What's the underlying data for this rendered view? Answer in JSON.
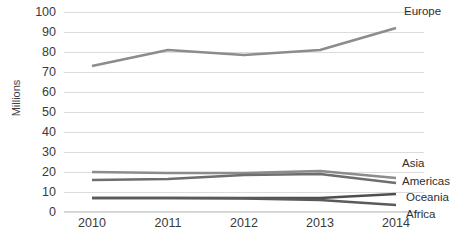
{
  "chart_data": {
    "type": "line",
    "title": "",
    "xlabel": "",
    "ylabel": "Millions",
    "categories": [
      "2010",
      "2011",
      "2012",
      "2013",
      "2014"
    ],
    "x": [
      2010,
      2011,
      2012,
      2013,
      2014
    ],
    "ylim": [
      0,
      100
    ],
    "ytick_values": [
      0,
      10,
      20,
      30,
      40,
      50,
      60,
      70,
      80,
      90,
      100
    ],
    "ytick_labels": [
      "0",
      "10",
      "20",
      "30",
      "40",
      "50",
      "60",
      "70",
      "80",
      "90",
      "100"
    ],
    "grid": true,
    "legend_position": "line-end-labels",
    "series": [
      {
        "name": "Europe",
        "values": [
          73,
          81,
          78.5,
          81,
          92
        ],
        "color": "#8c8c8c"
      },
      {
        "name": "Asia",
        "values": [
          20,
          19.5,
          19.5,
          20.5,
          17
        ],
        "color": "#8c8c8c"
      },
      {
        "name": "Americas",
        "values": [
          16,
          16.5,
          18.5,
          19,
          14.5
        ],
        "color": "#6e6e6e"
      },
      {
        "name": "Oceania",
        "values": [
          7,
          7,
          7,
          7,
          9
        ],
        "color": "#4f4f4f"
      },
      {
        "name": "Africa",
        "values": [
          7,
          7,
          6.8,
          6,
          3.5
        ],
        "color": "#5a5a5a"
      }
    ]
  },
  "axis": {
    "y_title": "Millions"
  }
}
